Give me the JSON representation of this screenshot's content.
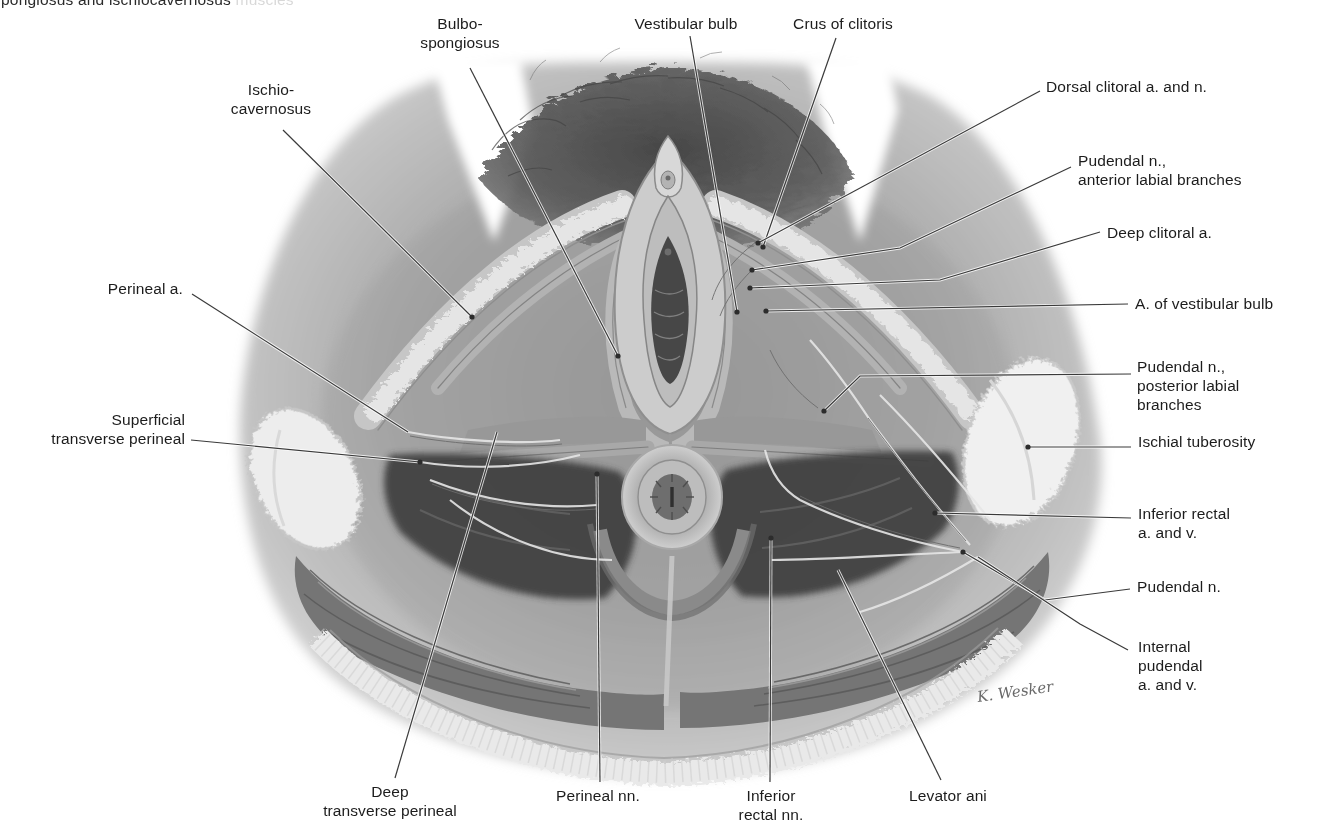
{
  "figure": {
    "cropped_caption": {
      "visible": "pongiosus and ischiocavernosus ",
      "faded": "muscles"
    },
    "signature": "K. Wesker",
    "colors": {
      "background": "#ffffff",
      "label_text": "#1c1c1c",
      "leader_line": "#3a3a3a"
    },
    "labels": [
      {
        "id": "bulbospongiosus",
        "text": "Bulbo-\nspongiosus",
        "align": "center",
        "x": 460,
        "y": 14,
        "line": [
          [
            470,
            68
          ],
          [
            618,
            356
          ]
        ],
        "dot": true
      },
      {
        "id": "vestibular-bulb",
        "text": "Vestibular bulb",
        "align": "center",
        "x": 686,
        "y": 14,
        "line": [
          [
            690,
            36
          ],
          [
            737,
            312
          ]
        ],
        "dot": true
      },
      {
        "id": "crus-of-clitoris",
        "text": "Crus of clitoris",
        "align": "center",
        "x": 843,
        "y": 14,
        "line": [
          [
            836,
            38
          ],
          [
            763,
            247
          ]
        ],
        "dot": true
      },
      {
        "id": "dorsal-clitoral-a-n",
        "text": "Dorsal clitoral a. and n.",
        "align": "left",
        "x": 1046,
        "y": 77,
        "line": [
          [
            1040,
            91
          ],
          [
            758,
            243
          ]
        ],
        "dot": true
      },
      {
        "id": "pudendal-n-anterior-labial",
        "text": "Pudendal n.,\nanterior labial branches",
        "align": "left",
        "x": 1078,
        "y": 151,
        "line": [
          [
            1071,
            167
          ],
          [
            900,
            248
          ],
          [
            752,
            270
          ]
        ],
        "dot": true
      },
      {
        "id": "deep-clitoral-a",
        "text": "Deep clitoral a.",
        "align": "left",
        "x": 1107,
        "y": 223,
        "line": [
          [
            1100,
            232
          ],
          [
            940,
            280
          ],
          [
            750,
            288
          ]
        ],
        "dot": true
      },
      {
        "id": "a-of-vestibular-bulb",
        "text": "A. of vestibular bulb",
        "align": "left",
        "x": 1135,
        "y": 294,
        "line": [
          [
            1128,
            304
          ],
          [
            766,
            311
          ]
        ],
        "dot": true
      },
      {
        "id": "pudendal-n-posterior-labial",
        "text": "Pudendal n.,\nposterior labial\nbranches",
        "align": "left",
        "x": 1137,
        "y": 357,
        "line": [
          [
            1131,
            374
          ],
          [
            860,
            376
          ],
          [
            824,
            411
          ]
        ],
        "dot": true
      },
      {
        "id": "ischial-tuberosity",
        "text": "Ischial tuberosity",
        "align": "left",
        "x": 1138,
        "y": 432,
        "line": [
          [
            1131,
            447
          ],
          [
            1028,
            447
          ]
        ],
        "dot": true
      },
      {
        "id": "inferior-rectal-a-v",
        "text": "Inferior rectal\na. and v.",
        "align": "left",
        "x": 1138,
        "y": 504,
        "line": [
          [
            1131,
            518
          ],
          [
            935,
            513
          ]
        ],
        "dot": true
      },
      {
        "id": "pudendal-n",
        "text": "Pudendal n.",
        "align": "left",
        "x": 1137,
        "y": 577,
        "line": [
          [
            1130,
            589
          ],
          [
            1045,
            600
          ],
          [
            963,
            552
          ]
        ],
        "dot": true
      },
      {
        "id": "internal-pudendal-a-v",
        "text": "Internal\npudendal\na. and v.",
        "align": "left",
        "x": 1138,
        "y": 637,
        "line": [
          [
            1128,
            650
          ],
          [
            1080,
            624
          ],
          [
            978,
            557
          ]
        ],
        "dot": false
      },
      {
        "id": "ischiocavernosus",
        "text": "Ischio-\ncavernosus",
        "align": "center",
        "x": 271,
        "y": 80,
        "line": [
          [
            283,
            130
          ],
          [
            472,
            317
          ]
        ],
        "dot": true
      },
      {
        "id": "perineal-a",
        "text": "Perineal a.",
        "align": "right",
        "x": 183,
        "y": 279,
        "line": [
          [
            192,
            294
          ],
          [
            408,
            432
          ]
        ],
        "dot": false
      },
      {
        "id": "superficial-transverse-perineal",
        "text": "Superficial\ntransverse perineal",
        "align": "right",
        "x": 185,
        "y": 410,
        "line": [
          [
            191,
            440
          ],
          [
            420,
            462
          ]
        ],
        "dot": true
      },
      {
        "id": "deep-transverse-perineal",
        "text": "Deep\ntransverse perineal",
        "align": "center",
        "x": 390,
        "y": 782,
        "line": [
          [
            395,
            778
          ],
          [
            497,
            432
          ]
        ],
        "dot": false
      },
      {
        "id": "perineal-nn",
        "text": "Perineal nn.",
        "align": "center",
        "x": 598,
        "y": 786,
        "line": [
          [
            600,
            782
          ],
          [
            597,
            474
          ]
        ],
        "dot": true
      },
      {
        "id": "inferior-rectal-nn",
        "text": "Inferior\nrectal nn.",
        "align": "center",
        "x": 771,
        "y": 786,
        "line": [
          [
            770,
            782
          ],
          [
            771,
            538
          ]
        ],
        "dot": true
      },
      {
        "id": "levator-ani",
        "text": "Levator ani",
        "align": "center",
        "x": 948,
        "y": 786,
        "line": [
          [
            941,
            780
          ],
          [
            838,
            570
          ]
        ],
        "dot": false
      }
    ]
  }
}
